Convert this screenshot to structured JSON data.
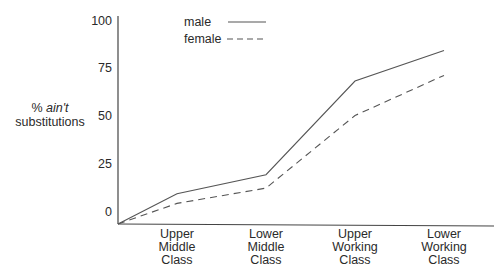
{
  "chart_data": {
    "type": "line",
    "title": "",
    "xlabel": "",
    "ylabel": "% ain't substitutions",
    "ylabel_lines": [
      {
        "prefix": "% ",
        "italic": "ain't"
      },
      {
        "text": "substitutions"
      }
    ],
    "categories": [
      [
        "Upper",
        "Middle",
        "Class"
      ],
      [
        "Lower",
        "Middle",
        "Class"
      ],
      [
        "Upper",
        "Working",
        "Class"
      ],
      [
        "Lower",
        "Working",
        "Class"
      ]
    ],
    "category_names": [
      "Upper Middle Class",
      "Lower Middle Class",
      "Upper Working Class",
      "Lower Working Class"
    ],
    "y_ticks": [
      0,
      25,
      50,
      75,
      100
    ],
    "ylim": [
      0,
      100
    ],
    "grid": false,
    "legend_position": "top-left inside plot",
    "series": [
      {
        "name": "male",
        "style": "solid",
        "values": [
          9,
          19,
          68,
          84
        ]
      },
      {
        "name": "female",
        "style": "dashed",
        "values": [
          4,
          12,
          50,
          71
        ]
      }
    ],
    "line_color": "#555555",
    "axis_color": "#444444"
  }
}
